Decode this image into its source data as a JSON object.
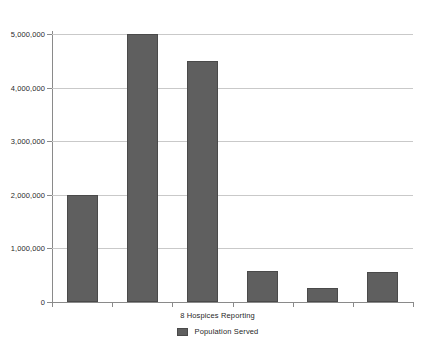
{
  "chart_data": {
    "type": "bar",
    "title": "",
    "subtitle": "",
    "xlabel": "8 Hospices Reporting",
    "ylabel": "",
    "categories": [
      "1",
      "2",
      "3",
      "4",
      "5",
      "6"
    ],
    "series": [
      {
        "name": "Population Served",
        "values": [
          2000000,
          5000000,
          4500000,
          570000,
          270000,
          560000
        ],
        "color": "#5f5f5f"
      }
    ],
    "ylim": [
      0,
      5000000
    ],
    "xlim": [
      0,
      6
    ],
    "ytick_values": [
      0,
      1000000,
      2000000,
      3000000,
      4000000,
      5000000
    ],
    "ytick_labels": [
      "0",
      "1,000,000",
      "2,000,000",
      "3,000,000",
      "4,000,000",
      "5,000,000"
    ],
    "xtick_labels": [
      "",
      "",
      "",
      "",
      "",
      ""
    ],
    "grid": true,
    "grid_axis": "y",
    "legend": {
      "position": "bottom",
      "entries": [
        {
          "label": "Population Served",
          "color": "#5f5f5f"
        }
      ]
    },
    "background_color": "#ffffff",
    "axis_color": "#8a8a8a",
    "gridline_color": "#c9c9c9"
  }
}
